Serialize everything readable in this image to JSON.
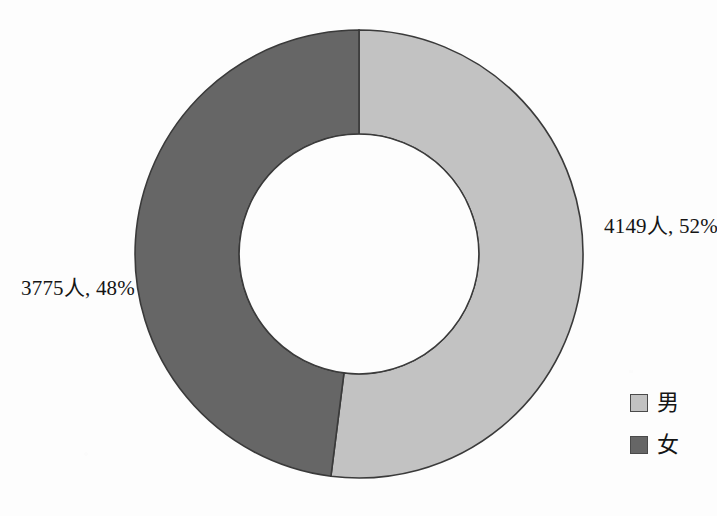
{
  "chart_data": {
    "type": "pie",
    "variant": "doughnut",
    "title": "",
    "legend_position": "right-bottom",
    "hole_ratio": 0.535,
    "start_angle_deg": 0,
    "direction": "clockwise",
    "categories": [
      "男",
      "女"
    ],
    "values": [
      4149,
      3775
    ],
    "percentages": [
      52,
      48
    ],
    "unit": "人",
    "colors": [
      "#c2c2c2",
      "#666666"
    ],
    "slices": [
      {
        "name": "男",
        "value": 4149,
        "percent": 52,
        "label": "4149人, 52%",
        "color": "#c2c2c2"
      },
      {
        "name": "女",
        "value": 3775,
        "percent": 48,
        "label": "3775人, 48%",
        "color": "#666666"
      }
    ]
  },
  "labels": {
    "male": "4149人, 52%",
    "female": "3775人, 48%"
  },
  "legend": {
    "items": [
      {
        "label": "男",
        "color": "#c2c2c2"
      },
      {
        "label": "女",
        "color": "#666666"
      }
    ]
  },
  "colors": {
    "male_segment": "#c2c2c2",
    "female_segment": "#666666",
    "outline": "#3a3a3a",
    "background": "#fdfdfd",
    "text": "#151515"
  }
}
